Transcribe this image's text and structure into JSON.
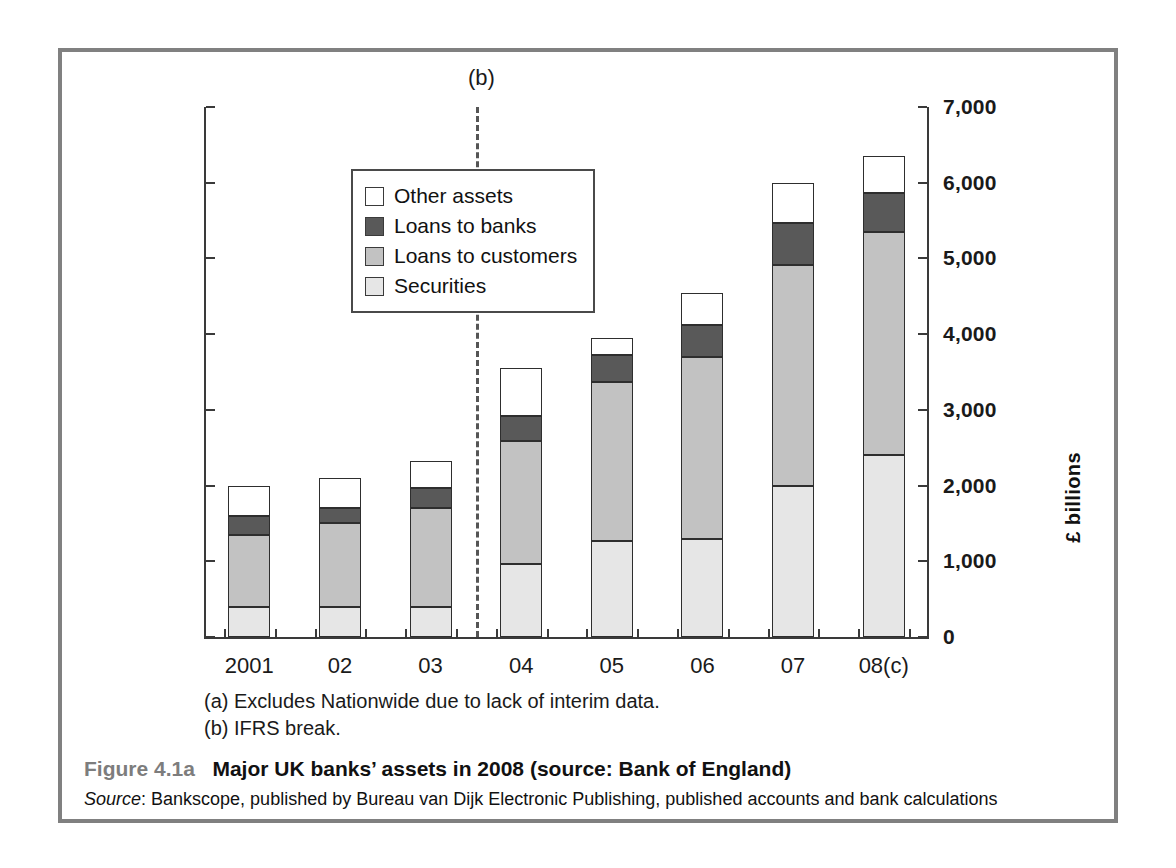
{
  "figure": {
    "caption_number": "Figure 4.1a",
    "caption_title": "Major UK banks’ assets in 2008 (source: Bank of England)",
    "source_label": "Source",
    "source_text": ": Bankscope, published by Bureau van Dijk Electronic Publishing, published accounts and bank calculations"
  },
  "notes": {
    "a": "(a) Excludes Nationwide due to lack of interim data.",
    "b": "(b) IFRS break."
  },
  "annotations": {
    "break_marker": "(b)"
  },
  "colors": {
    "other_assets": "#ffffff",
    "loans_to_banks": "#595959",
    "loans_to_customers": "#c2c2c2",
    "securities": "#e6e6e6",
    "frame": "#808080",
    "axis": "#3a3a3a"
  },
  "chart_data": {
    "type": "bar",
    "stacked": true,
    "title": "Major UK banks’ assets in 2008",
    "xlabel": "",
    "ylabel": "£ billions",
    "ylim": [
      0,
      7000
    ],
    "ytick_values": [
      0,
      1000,
      2000,
      3000,
      4000,
      5000,
      6000,
      7000
    ],
    "ytick_labels": [
      "0",
      "1,000",
      "2,000",
      "3,000",
      "4,000",
      "5,000",
      "6,000",
      "7,000"
    ],
    "yaxis_position": "right",
    "grid": false,
    "legend_position": "upper-left",
    "categories": [
      "2001",
      "02",
      "03",
      "04",
      "05",
      "06",
      "07",
      "08(c)"
    ],
    "series": [
      {
        "name": "Securities",
        "color": "#e6e6e6",
        "values": [
          400,
          400,
          400,
          970,
          1270,
          1300,
          2000,
          2400
        ]
      },
      {
        "name": "Loans to customers",
        "color": "#c2c2c2",
        "values": [
          950,
          1100,
          1300,
          1620,
          2100,
          2400,
          2920,
          2950
        ]
      },
      {
        "name": "Loans to banks",
        "color": "#595959",
        "values": [
          250,
          200,
          270,
          330,
          350,
          420,
          550,
          510
        ]
      },
      {
        "name": "Other assets",
        "color": "#ffffff",
        "values": [
          400,
          400,
          350,
          630,
          230,
          430,
          530,
          490
        ]
      }
    ],
    "totals": [
      2000,
      2100,
      2320,
      3550,
      3950,
      4550,
      6000,
      6350
    ],
    "legend_order": [
      "Other assets",
      "Loans to banks",
      "Loans to customers",
      "Securities"
    ],
    "annotations": [
      {
        "text": "(b)",
        "x_between": [
          "03",
          "04"
        ],
        "style": "vertical-dashed-line"
      }
    ]
  }
}
